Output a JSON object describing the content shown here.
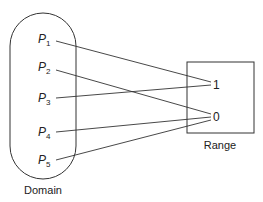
{
  "diagram": {
    "domain": {
      "label": "Domain",
      "elements": [
        {
          "name": "P",
          "sub": "1",
          "maps_to": "1"
        },
        {
          "name": "P",
          "sub": "2",
          "maps_to": "0"
        },
        {
          "name": "P",
          "sub": "3",
          "maps_to": "1"
        },
        {
          "name": "P",
          "sub": "4",
          "maps_to": "0"
        },
        {
          "name": "P",
          "sub": "5",
          "maps_to": "0"
        }
      ]
    },
    "range": {
      "label": "Range",
      "values": [
        "1",
        "0"
      ]
    },
    "colors": {
      "stroke": "#333333",
      "text": "#222222",
      "background": "#ffffff"
    }
  }
}
